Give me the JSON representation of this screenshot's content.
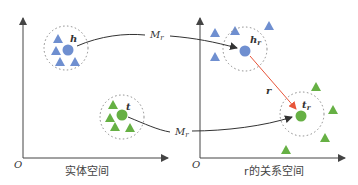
{
  "diagram": {
    "type": "embedding-projection",
    "colors": {
      "head": "#6f8fd0",
      "tail": "#66b044",
      "axis": "#444444",
      "mapping_arrow": "#333333",
      "relation_arrow": "#e8553a",
      "dotted_circle": "#888888"
    },
    "left_panel": {
      "origin_label": "O",
      "caption": "实体空间",
      "head_label": "h",
      "tail_label": "t"
    },
    "right_panel": {
      "origin_label": "O",
      "caption": "r的关系空间",
      "head_label": "h",
      "head_sub": "r",
      "tail_label": "t",
      "tail_sub": "r",
      "relation_label": "r"
    },
    "mappings": [
      {
        "label": "M",
        "sub": "r",
        "from": "h",
        "to": "h_r"
      },
      {
        "label": "M",
        "sub": "r",
        "from": "t",
        "to": "t_r"
      }
    ]
  }
}
